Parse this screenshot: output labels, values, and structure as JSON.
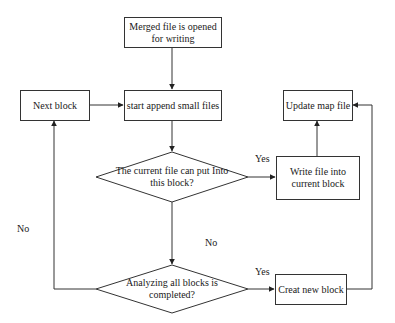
{
  "diagram": {
    "type": "flowchart",
    "nodes": {
      "merged_open": {
        "shape": "rectangle",
        "text": "Merged  file is opened for writing"
      },
      "next_block": {
        "shape": "rectangle",
        "text": "Next block"
      },
      "start_append": {
        "shape": "rectangle",
        "text": "start append small files"
      },
      "update_map": {
        "shape": "rectangle",
        "text": "Update map file"
      },
      "can_put": {
        "shape": "diamond",
        "text": "The current file can put Into this block?"
      },
      "write_file": {
        "shape": "rectangle",
        "text": "Write file  into current block"
      },
      "all_analyzed": {
        "shape": "diamond",
        "text": "Analyzing all blocks is completed?"
      },
      "create_block": {
        "shape": "rectangle",
        "text": "Creat new block"
      }
    },
    "edge_labels": {
      "can_put_yes": "Yes",
      "can_put_no": "No",
      "all_analyzed_yes": "Yes",
      "all_analyzed_no": "No"
    },
    "edges": [
      {
        "from": "merged_open",
        "to": "start_append"
      },
      {
        "from": "next_block",
        "to": "start_append"
      },
      {
        "from": "start_append",
        "to": "can_put"
      },
      {
        "from": "can_put",
        "to": "write_file",
        "label": "Yes"
      },
      {
        "from": "write_file",
        "to": "update_map"
      },
      {
        "from": "can_put",
        "to": "all_analyzed",
        "label": "No"
      },
      {
        "from": "all_analyzed",
        "to": "create_block",
        "label": "Yes"
      },
      {
        "from": "all_analyzed",
        "to": "next_block",
        "label": "No"
      },
      {
        "from": "create_block",
        "to": "update_map"
      }
    ],
    "colors": {
      "stroke": "#333333",
      "text": "#1a1a1a",
      "background": "#ffffff"
    }
  }
}
